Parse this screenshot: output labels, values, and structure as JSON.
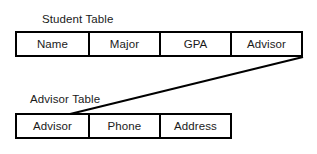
{
  "diagram": {
    "title_student": "Student Table",
    "title_advisor": "Advisor Table",
    "student_table": {
      "label": "Student Table",
      "columns": [
        "Name",
        "Major",
        "GPA",
        "Advisor"
      ]
    },
    "advisor_table": {
      "label": "Advisor Table",
      "columns": [
        "Advisor",
        "Phone",
        "Address"
      ]
    },
    "relationship": {
      "from_table": "Student Table",
      "from_column": "Advisor",
      "to_table": "Advisor Table",
      "to_column": "Advisor"
    },
    "colors": {
      "background": "#ffffff",
      "border": "#000000",
      "text": "#1a1a1a",
      "connector": "#000000"
    }
  }
}
